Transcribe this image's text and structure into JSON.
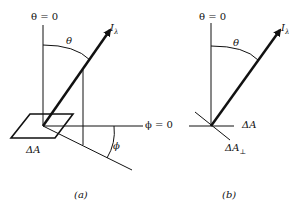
{
  "panels": [
    {
      "id": "a",
      "caption": "(a)",
      "labels": {
        "zenith": "θ = 0",
        "theta": "θ",
        "intensity": "I",
        "intensity_sub": "λ",
        "azimuth_ref": "ϕ = 0",
        "phi": "ϕ",
        "area": "ΔA"
      }
    },
    {
      "id": "b",
      "caption": "(b)",
      "labels": {
        "zenith": "θ = 0",
        "theta": "θ",
        "intensity": "I",
        "intensity_sub": "λ",
        "area": "ΔA",
        "projected_area": "ΔA",
        "projected_area_sub": "⊥"
      }
    }
  ]
}
